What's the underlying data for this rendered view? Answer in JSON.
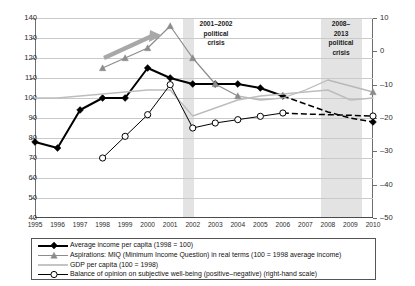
{
  "chart_data": {
    "type": "line",
    "title": "",
    "xlabel": "",
    "ylabel": "",
    "grid": true,
    "legend_position": "bottom",
    "x": [
      1995,
      1996,
      1997,
      1998,
      1999,
      2000,
      2001,
      2002,
      2003,
      2004,
      2005,
      2006,
      2007,
      2008,
      2009,
      2010
    ],
    "xtick_labels": [
      "1995",
      "1996",
      "1997",
      "1998",
      "1999",
      "2000",
      "2001",
      "2002",
      "2003",
      "2004",
      "2005",
      "2006",
      "2007",
      "2008",
      "2009",
      "2010"
    ],
    "ylim": [
      40,
      140
    ],
    "ytick_labels": [
      "140",
      "130",
      "120",
      "110",
      "100",
      "90",
      "80",
      "70",
      "60",
      "50",
      "40"
    ],
    "y2lim": [
      -50,
      10
    ],
    "y2tick_labels": [
      "10",
      "0",
      "–10",
      "–20",
      "–30",
      "–40",
      "–50"
    ],
    "series": [
      {
        "name": "Average income per capita (1998 = 100)",
        "marker": "diamond",
        "color": "#000000",
        "axis": "left",
        "values": [
          78,
          75,
          94,
          100,
          100,
          115,
          110,
          107,
          107,
          107,
          105,
          101,
          null,
          null,
          null,
          null
        ],
        "projection": [
          null,
          null,
          null,
          null,
          null,
          null,
          null,
          null,
          null,
          null,
          null,
          101,
          97,
          93,
          90,
          88
        ],
        "projection_style": "dashed"
      },
      {
        "name": "Aspirations: MIQ (Minimum Income Question) in real terms  (100 =  1998 average income)",
        "marker": "triangle",
        "color": "#8c8c8c",
        "axis": "left",
        "values": [
          null,
          null,
          null,
          115,
          120,
          125,
          136,
          120,
          107,
          101,
          null,
          null,
          null,
          null,
          null,
          null
        ],
        "projection": [
          null,
          null,
          null,
          null,
          null,
          null,
          null,
          null,
          null,
          101,
          99,
          100,
          104,
          109,
          106,
          103
        ],
        "projection_style": "solid-light"
      },
      {
        "name": "GDP per capita (100 = 1998)",
        "marker": "none",
        "color": "#b4b4b4",
        "axis": "left",
        "values": [
          100,
          100,
          101,
          102,
          103,
          104,
          104,
          91,
          95,
          99,
          101,
          102,
          103,
          104,
          99,
          100
        ]
      },
      {
        "name": "Balance of opinion on subjective well-being (positive–negative) (right-hand scale)",
        "marker": "circle",
        "color": "#000000",
        "axis": "right",
        "values": [
          null,
          null,
          null,
          -32,
          -25.5,
          -19,
          -10,
          -23,
          -21.5,
          -20.5,
          -19.5,
          -18.5,
          null,
          null,
          null,
          null
        ],
        "projection": [
          null,
          null,
          null,
          null,
          null,
          null,
          null,
          null,
          null,
          null,
          null,
          -18.5,
          -18.8,
          -19,
          -19.2,
          -19.4
        ],
        "projection_style": "dashed"
      }
    ],
    "annotations": [
      {
        "name": "crisis-band-1",
        "label": "2001–2002\npolitical\ncrisis",
        "label_lines": [
          "2001–2002",
          "political",
          "crisis"
        ],
        "x_from": 2001,
        "x_to": 2002
      },
      {
        "name": "crisis-band-2",
        "label": "2008–2013 political crisis",
        "label_lines": [
          "2008–",
          "2013",
          "political",
          "crisis"
        ],
        "x_from": 2008,
        "x_to": 2010
      },
      {
        "name": "aspirations-trend-arrow",
        "label": ""
      }
    ]
  },
  "legend": {
    "items": [
      {
        "label": "Average income per capita (1998 = 100)"
      },
      {
        "label": "Aspirations: MIQ (Minimum Income Question) in real terms  (100 =  1998 average income)"
      },
      {
        "label": "GDP per capita (100 = 1998)"
      },
      {
        "label": "Balance of opinion on subjective well-being (positive–negative) (right-hand scale)"
      }
    ]
  },
  "bands": {
    "first": {
      "l1": "2001–2002",
      "l2": "political",
      "l3": "crisis"
    },
    "second": {
      "l1": "2008–",
      "l2": "2013",
      "l3": "political",
      "l4": "crisis"
    }
  }
}
